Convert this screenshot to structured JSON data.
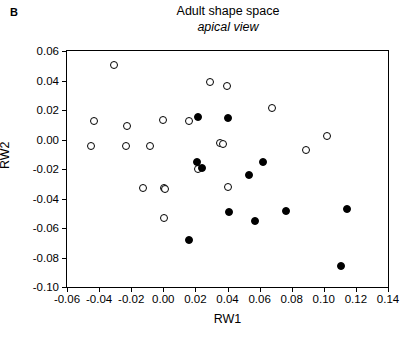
{
  "panel": {
    "label": "B"
  },
  "title": {
    "main": "Adult shape space",
    "sub": "apical view"
  },
  "axis_titles": {
    "x": "RW1",
    "y": "RW2"
  },
  "chart_data": {
    "type": "scatter",
    "title": "Adult shape space",
    "subtitle": "apical view",
    "xlabel": "RW1",
    "ylabel": "RW2",
    "xlim": [
      -0.06,
      0.14
    ],
    "ylim": [
      -0.1,
      0.06
    ],
    "xticks": [
      -0.06,
      -0.04,
      -0.02,
      0.0,
      0.02,
      0.04,
      0.06,
      0.08,
      0.1,
      0.12,
      0.14
    ],
    "xticklabels": [
      "-0.06",
      "-0.04",
      "-0.02",
      "0.00",
      "0.02",
      "0.04",
      "0.06",
      "0.08",
      "0.10",
      "0.12",
      "0.14"
    ],
    "yticks": [
      0.06,
      0.04,
      0.02,
      0.0,
      -0.02,
      -0.04,
      -0.06,
      -0.08,
      -0.1
    ],
    "yticklabels": [
      "0.06",
      "0.04",
      "0.02",
      "0.00",
      "-0.02",
      "-0.04",
      "-0.06",
      "-0.08",
      "-0.10"
    ],
    "grid": false,
    "legend": "none",
    "marker_colors": {
      "open": "#ffffff",
      "filled": "#000000",
      "edge": "#000000"
    },
    "series": [
      {
        "name": "open circles",
        "marker": "open",
        "points": [
          [
            -0.0305,
            0.0503
          ],
          [
            -0.0432,
            0.0123
          ],
          [
            -0.045,
            -0.0043
          ],
          [
            -0.0228,
            0.0091
          ],
          [
            -0.0234,
            -0.0042
          ],
          [
            -0.008,
            -0.0041
          ],
          [
            -0.0127,
            -0.0331
          ],
          [
            -0.0002,
            0.013
          ],
          [
            0.0003,
            -0.0327
          ],
          [
            0.0013,
            -0.0335
          ],
          [
            0.0002,
            -0.053
          ],
          [
            0.0163,
            0.0128
          ],
          [
            0.0215,
            -0.0201
          ],
          [
            0.0288,
            0.0387
          ],
          [
            0.0353,
            -0.0027
          ],
          [
            0.0372,
            -0.003
          ],
          [
            0.0394,
            0.0363
          ],
          [
            0.0405,
            -0.0321
          ],
          [
            0.0678,
            0.0212
          ],
          [
            0.0888,
            -0.0074
          ],
          [
            0.1018,
            0.0021
          ]
        ]
      },
      {
        "name": "filled circles",
        "marker": "filled",
        "points": [
          [
            0.0218,
            0.0152
          ],
          [
            0.0406,
            0.0147
          ],
          [
            0.0213,
            -0.015
          ],
          [
            0.024,
            -0.0192
          ],
          [
            0.062,
            -0.0152
          ],
          [
            0.0537,
            -0.0243
          ],
          [
            0.0409,
            -0.0491
          ],
          [
            0.0572,
            -0.0554
          ],
          [
            0.0765,
            -0.0482
          ],
          [
            0.1143,
            -0.0474
          ],
          [
            0.0163,
            -0.0678
          ],
          [
            0.1107,
            -0.0858
          ]
        ]
      }
    ]
  }
}
